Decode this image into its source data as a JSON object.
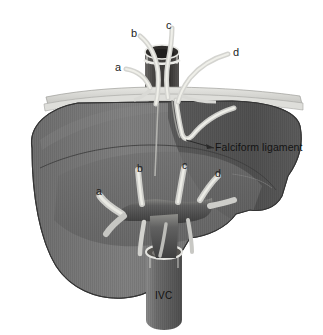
{
  "figure": {
    "style": "grayscale medical illustration",
    "background_color": "#ffffff"
  },
  "colors": {
    "background": "#ffffff",
    "liver_left_lobe": "#7c7c7c",
    "liver_right_lobe": "#565656",
    "liver_anterior_segment": "#6d6d6d",
    "liver_outline": "#3a3a3a",
    "diaphragm_band": "#d8d8d4",
    "vessel_light": "#d6d6d2",
    "vessel_dark": "#4a4a4a",
    "cuff_lumen": "#33312f",
    "ivc_body": "#6a6a6a",
    "label_text": "#1d1d1d",
    "leader_line": "#2a2a2a"
  },
  "labels": {
    "upper_veins": [
      {
        "id": "a",
        "text": "a",
        "x": 115,
        "y": 62,
        "describes": "hepatic vein a (upper view)"
      },
      {
        "id": "b",
        "text": "b",
        "x": 131,
        "y": 28,
        "describes": "hepatic vein b (upper view)"
      },
      {
        "id": "c",
        "text": "c",
        "x": 166,
        "y": 20,
        "describes": "hepatic vein c (upper view)"
      },
      {
        "id": "d",
        "text": "d",
        "x": 233,
        "y": 47,
        "describes": "hepatic vein d (upper view)"
      }
    ],
    "lower_veins": [
      {
        "id": "a",
        "text": "a",
        "x": 96,
        "y": 186,
        "describes": "hepatic vein a (intrahepatic)"
      },
      {
        "id": "b",
        "text": "b",
        "x": 137,
        "y": 163,
        "describes": "hepatic vein b (intrahepatic)"
      },
      {
        "id": "c",
        "text": "c",
        "x": 182,
        "y": 160,
        "describes": "hepatic vein c (intrahepatic)"
      },
      {
        "id": "d",
        "text": "d",
        "x": 215,
        "y": 168,
        "describes": "hepatic vein d (intrahepatic)"
      }
    ],
    "annotations": [
      {
        "id": "falciform",
        "text": "Falciform ligament",
        "x": 215,
        "y": 147,
        "describes": "falciform ligament with leader line"
      },
      {
        "id": "ivc",
        "text": "IVC",
        "x": 164,
        "y": 296,
        "describes": "inferior vena cava trunk label"
      }
    ]
  },
  "structures": {
    "liver": "liver parenchyma shown in three shaded tonal regions",
    "diaphragm": "pale horizontal band across the superior liver surface",
    "suprahepatic_cuff": "cylindrical vena cava cuff above the diaphragm",
    "confluence": "hepatic venous confluence draining into the IVC",
    "ivc": "inferior vena cava descending below the liver"
  }
}
